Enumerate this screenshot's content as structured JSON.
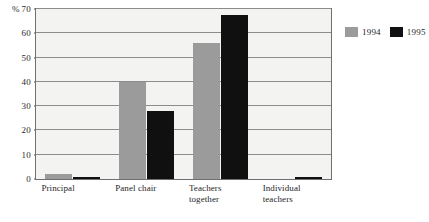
{
  "chart_data": {
    "type": "bar",
    "title": "",
    "xlabel": "",
    "ylabel": "%",
    "ylim": [
      0,
      70
    ],
    "ytick_step": 10,
    "yticks": [
      "0",
      "10",
      "20",
      "30",
      "40",
      "50",
      "60",
      "70"
    ],
    "ytick_top_prefix": "%",
    "grid": true,
    "legend_position": "top-right",
    "categories": [
      "Principal",
      "Panel chair",
      "Teachers together",
      "Individual teachers"
    ],
    "category_lines": [
      [
        "Principal"
      ],
      [
        "Panel chair"
      ],
      [
        "Teachers",
        "together"
      ],
      [
        "Individual",
        "teachers"
      ]
    ],
    "series": [
      {
        "name": "1994",
        "color": "#9b9b9b",
        "values": [
          2,
          40,
          56,
          0
        ]
      },
      {
        "name": "1995",
        "color": "#101010",
        "values": [
          1,
          28,
          67.5,
          1
        ]
      }
    ]
  },
  "legend": {
    "items": [
      {
        "label": "1994",
        "color": "#9b9b9b"
      },
      {
        "label": "1995",
        "color": "#101010"
      }
    ]
  },
  "colors": {
    "plot_background": "#f3f3f1",
    "frame": "#6f6f6f",
    "gridline": "#8c8c8c",
    "series_1994": "#9b9b9b",
    "series_1995": "#101010",
    "text": "#1f1f1f"
  }
}
